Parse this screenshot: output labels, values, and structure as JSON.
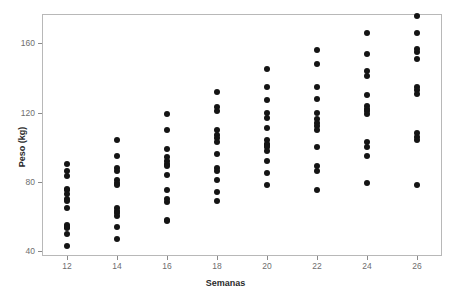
{
  "chart_data": {
    "type": "scatter",
    "title": "",
    "xlabel": "Semanas",
    "ylabel": "Peso (kg)",
    "xlim": [
      11.0,
      27.0
    ],
    "ylim": [
      37.0,
      177.0
    ],
    "xticks": [
      12,
      14,
      16,
      18,
      20,
      22,
      24,
      26
    ],
    "xtick_labels": [
      "12",
      "14",
      "16",
      "18",
      "20",
      "22",
      "24",
      "26"
    ],
    "yticks": [
      40,
      80,
      120,
      160
    ],
    "ytick_labels": [
      "40",
      "80",
      "120",
      "160"
    ],
    "grid": false,
    "legend": null,
    "marker": {
      "shape": "circle",
      "color": "#141414",
      "size": 6
    },
    "series": [
      {
        "name": "Peso por semana",
        "points": [
          [
            12,
            90
          ],
          [
            12,
            86
          ],
          [
            12,
            83
          ],
          [
            12,
            76
          ],
          [
            12,
            75
          ],
          [
            12,
            73
          ],
          [
            12,
            70
          ],
          [
            12,
            69
          ],
          [
            12,
            65
          ],
          [
            12,
            55
          ],
          [
            12,
            54
          ],
          [
            12,
            53
          ],
          [
            12,
            50
          ],
          [
            12,
            43
          ],
          [
            14,
            104
          ],
          [
            14,
            95
          ],
          [
            14,
            88
          ],
          [
            14,
            86
          ],
          [
            14,
            81
          ],
          [
            14,
            79
          ],
          [
            14,
            78
          ],
          [
            14,
            65
          ],
          [
            14,
            63
          ],
          [
            14,
            62
          ],
          [
            14,
            60
          ],
          [
            14,
            54
          ],
          [
            14,
            47
          ],
          [
            16,
            119
          ],
          [
            16,
            110
          ],
          [
            16,
            99
          ],
          [
            16,
            94
          ],
          [
            16,
            92
          ],
          [
            16,
            90
          ],
          [
            16,
            89
          ],
          [
            16,
            84
          ],
          [
            16,
            75
          ],
          [
            16,
            70
          ],
          [
            16,
            68
          ],
          [
            16,
            58
          ],
          [
            16,
            57
          ],
          [
            18,
            132
          ],
          [
            18,
            123
          ],
          [
            18,
            121
          ],
          [
            18,
            110
          ],
          [
            18,
            107
          ],
          [
            18,
            105
          ],
          [
            18,
            103
          ],
          [
            18,
            96
          ],
          [
            18,
            88
          ],
          [
            18,
            86
          ],
          [
            18,
            81
          ],
          [
            18,
            74
          ],
          [
            18,
            69
          ],
          [
            20,
            145
          ],
          [
            20,
            135
          ],
          [
            20,
            127
          ],
          [
            20,
            120
          ],
          [
            20,
            117
          ],
          [
            20,
            111
          ],
          [
            20,
            104
          ],
          [
            20,
            102
          ],
          [
            20,
            101
          ],
          [
            20,
            100
          ],
          [
            20,
            98
          ],
          [
            20,
            92
          ],
          [
            20,
            85
          ],
          [
            20,
            78
          ],
          [
            22,
            156
          ],
          [
            22,
            148
          ],
          [
            22,
            135
          ],
          [
            22,
            128
          ],
          [
            22,
            120
          ],
          [
            22,
            116
          ],
          [
            22,
            114
          ],
          [
            22,
            112
          ],
          [
            22,
            110
          ],
          [
            22,
            100
          ],
          [
            22,
            89
          ],
          [
            22,
            86
          ],
          [
            22,
            75
          ],
          [
            24,
            166
          ],
          [
            24,
            154
          ],
          [
            24,
            144
          ],
          [
            24,
            141
          ],
          [
            24,
            130
          ],
          [
            24,
            124
          ],
          [
            24,
            122
          ],
          [
            24,
            121
          ],
          [
            24,
            119
          ],
          [
            24,
            103
          ],
          [
            24,
            100
          ],
          [
            24,
            95
          ],
          [
            24,
            79
          ],
          [
            26,
            176
          ],
          [
            26,
            166
          ],
          [
            26,
            157
          ],
          [
            26,
            155
          ],
          [
            26,
            151
          ],
          [
            26,
            135
          ],
          [
            26,
            133
          ],
          [
            26,
            131
          ],
          [
            26,
            108
          ],
          [
            26,
            106
          ],
          [
            26,
            104
          ],
          [
            26,
            78
          ]
        ]
      }
    ]
  },
  "axis": {
    "ylabel": "Peso (kg)",
    "xlabel": "Semanas"
  }
}
